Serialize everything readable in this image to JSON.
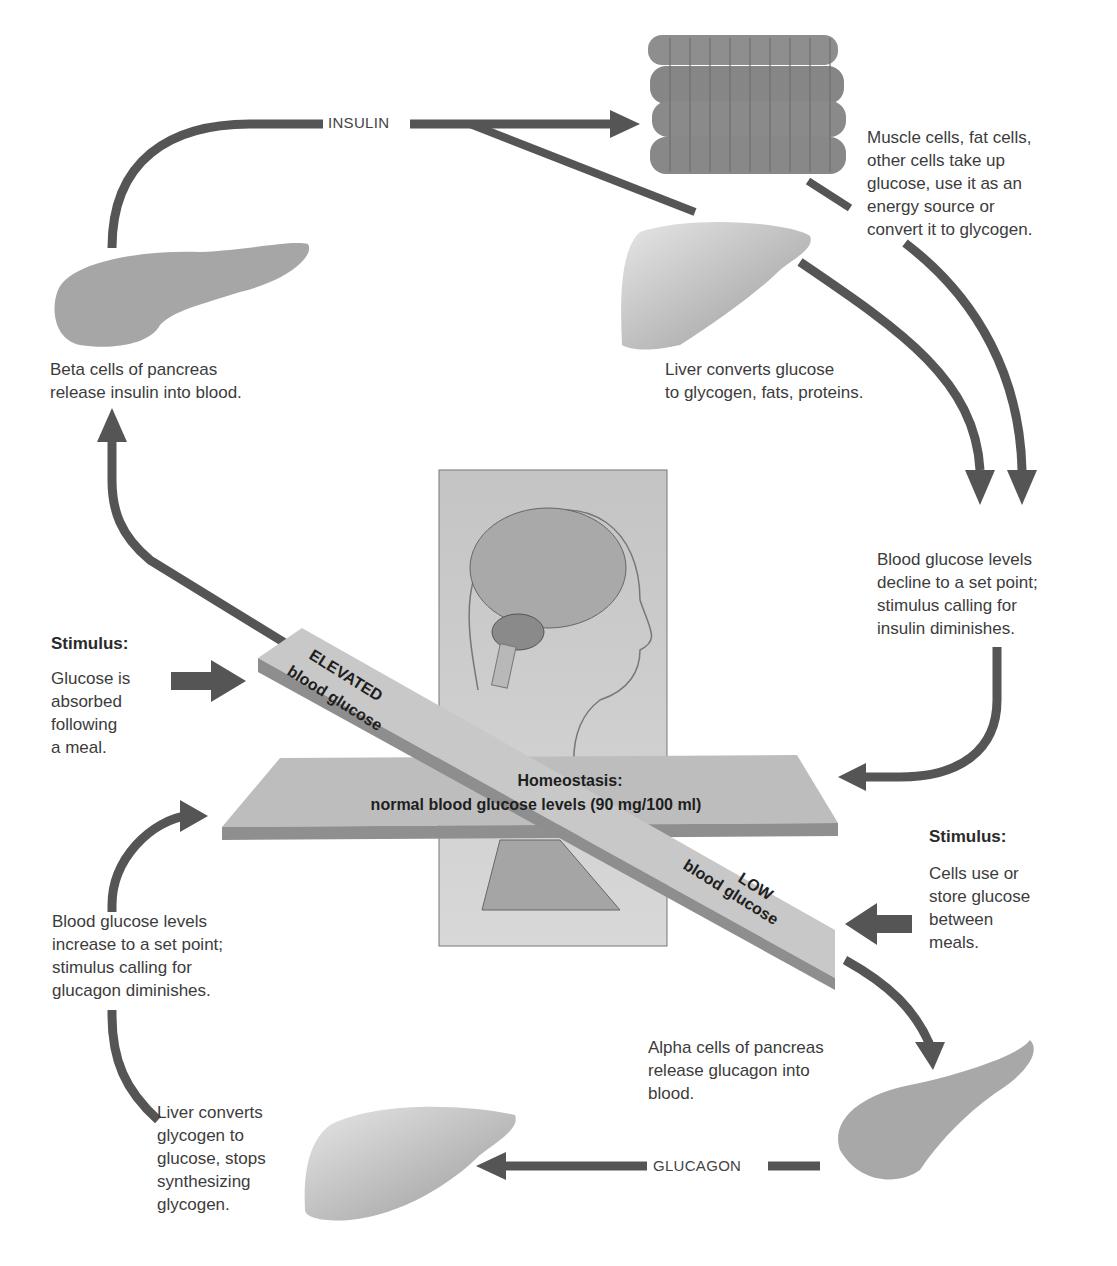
{
  "diagram": {
    "colors": {
      "arrow": "#555555",
      "organ": "#a8a8a8",
      "board": "#b9b9b9",
      "panel": "#cfcfcf",
      "text": "#3c3c3c"
    },
    "flow_labels": {
      "insulin": "INSULIN",
      "glucagon": "GLUCAGON"
    },
    "seesaw": {
      "elevated_line1": "ELEVATED",
      "elevated_line2": "blood glucose",
      "low_line1": "LOW",
      "low_line2": "blood glucose",
      "homeostasis_title": "Homeostasis:",
      "homeostasis_detail": "normal blood glucose levels (90 mg/100 ml)"
    },
    "stimulus_high": {
      "title": "Stimulus:",
      "text": "Glucose is\nabsorbed\nfollowing\na meal."
    },
    "stimulus_low": {
      "title": "Stimulus:",
      "text": "Cells use or\nstore glucose\nbetween\nmeals."
    },
    "labels": {
      "beta_cells": "Beta cells of pancreas\nrelease insulin into blood.",
      "muscle_cells": "Muscle cells, fat cells,\nother cells take up\nglucose, use it as an\nenergy source or\nconvert it to glycogen.",
      "liver_glycogen": "Liver converts glucose\nto glycogen, fats, proteins.",
      "decline": "Blood glucose levels\ndecline to a set point;\nstimulus calling for\ninsulin diminishes.",
      "increase": "Blood glucose levels\nincrease to a set point;\nstimulus calling for\nglucagon diminishes.",
      "alpha_cells": "Alpha cells of pancreas\nrelease glucagon into\nblood.",
      "liver_glucose": "Liver converts\nglycogen to\nglucose, stops\nsynthesizing\nglycogen."
    },
    "icons": [
      "pancreas-icon",
      "muscle-fibers-icon",
      "liver-icon",
      "brain-head-icon",
      "seesaw-icon",
      "arrow-icon"
    ]
  }
}
